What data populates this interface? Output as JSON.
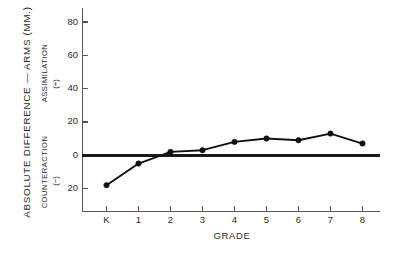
{
  "chart_data": {
    "type": "line",
    "title": "",
    "xlabel": "GRADE",
    "ylabel": "ABSOLUTE DIFFERENCE — ARMS  (MM.)",
    "categories": [
      "K",
      "1",
      "2",
      "3",
      "4",
      "5",
      "6",
      "7",
      "8"
    ],
    "values": [
      -18,
      -5,
      2,
      3,
      8,
      10,
      9,
      13,
      7
    ],
    "series": [
      {
        "name": "Absolute difference — arms",
        "values": [
          -18,
          -5,
          2,
          3,
          8,
          10,
          9,
          13,
          7
        ]
      }
    ],
    "ylim": [
      -28,
      88
    ],
    "ytick_values": [
      80,
      60,
      40,
      20,
      0,
      -20
    ],
    "ytick_labels": [
      "80",
      "60",
      "40",
      "20",
      "0",
      "20"
    ],
    "xtick_labels": [
      "K",
      "1",
      "2",
      "3",
      "4",
      "5",
      "6",
      "7",
      "8"
    ],
    "grid": false,
    "legend": "none",
    "zero_reference_line": true,
    "upper_region_label": "ASSIMILATION",
    "upper_region_sign": "(+)",
    "lower_region_label": "COUNTERACTION",
    "lower_region_sign": "(−)",
    "marker": "filled-circle",
    "line_color": "#111111",
    "axis_color": "#555555",
    "background_color": "#ffffff"
  },
  "axes": {
    "y_title_outer": "ABSOLUTE DIFFERENCE — ARMS  (MM.)",
    "y_title_upper": "ASSIMILATION",
    "y_sign_upper": "(+)",
    "y_title_lower": "COUNTERACTION",
    "y_sign_lower": "(−)",
    "x_title": "GRADE"
  },
  "ytick_labels": {
    "t0": "80",
    "t1": "60",
    "t2": "40",
    "t3": "20",
    "t4": "0",
    "t5": "20"
  },
  "xtick_labels": {
    "t0": "K",
    "t1": "1",
    "t2": "2",
    "t3": "3",
    "t4": "4",
    "t5": "5",
    "t6": "6",
    "t7": "7",
    "t8": "8"
  }
}
